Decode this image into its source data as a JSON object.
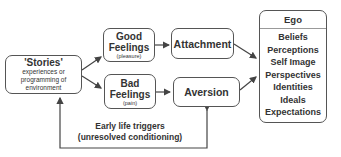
{
  "stories": {
    "title": "'Stories'",
    "lines": [
      "experiences or",
      "programming of",
      "environment"
    ]
  },
  "good": {
    "title1": "Good",
    "title2": "Feelings",
    "sub": "(pleasure)"
  },
  "bad": {
    "title1": "Bad",
    "title2": "Feelings",
    "sub": "(pain)"
  },
  "attachment": "Attachment",
  "aversion": "Aversion",
  "ego": {
    "title": "Ego",
    "items": [
      "Beliefs",
      "Perceptions",
      "Self Image",
      "Perspectives",
      "Identities",
      "Ideals",
      "Expectations"
    ]
  },
  "feedback": {
    "line1": "Early life triggers",
    "line2": "(unresolved conditioning)"
  }
}
